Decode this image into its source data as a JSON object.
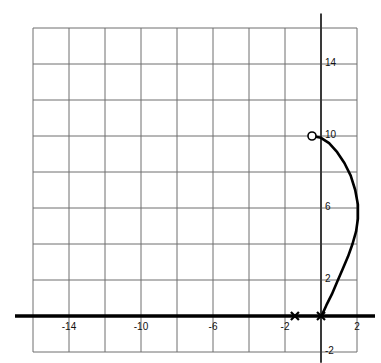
{
  "figure": {
    "kind": "cartesian-graph",
    "background_color": "#ffffff",
    "grid_color": "#6e6e6e",
    "axis_color": "#000000",
    "curve_color": "#000000"
  },
  "axes": {
    "x": {
      "label": "",
      "min": -16,
      "max": 2,
      "step": 2,
      "tick_labels": [
        "-14",
        "-10",
        "-6",
        "-2",
        "2"
      ],
      "tick_values": [
        -14,
        -10,
        -6,
        -2,
        2
      ],
      "axis_line_y": 0,
      "axis_line_from": -17,
      "axis_line_to": 3
    },
    "y": {
      "label": "",
      "min": -2,
      "max": 16,
      "step": 2,
      "tick_labels": [
        "14",
        "10",
        "6",
        "2",
        "-2"
      ],
      "tick_values": [
        14,
        10,
        6,
        2,
        -2
      ],
      "axis_line_x": 0,
      "axis_line_from": -2.6,
      "axis_line_to": 16.8
    },
    "grid": {
      "visible": true,
      "columns": 9,
      "rows": 9,
      "x_lines": [
        -16,
        -14,
        -12,
        -10,
        -8,
        -6,
        -4,
        -2,
        0,
        2
      ],
      "y_lines": [
        -2,
        0,
        2,
        4,
        6,
        8,
        10,
        12,
        14,
        16
      ]
    }
  },
  "chart_data": {
    "type": "line",
    "title": "",
    "subtitle": "",
    "xlabel": "",
    "ylabel": "",
    "xlim": [
      -16,
      2
    ],
    "ylim": [
      -2,
      16
    ],
    "grid": true,
    "legend": "none",
    "series": [
      {
        "name": "curve",
        "type": "parametric-arc",
        "color": "#000000",
        "line_width": 2.6,
        "points": [
          [
            -0.5,
            10.0
          ],
          [
            0.0,
            9.9
          ],
          [
            0.45,
            9.6
          ],
          [
            0.9,
            9.1
          ],
          [
            1.3,
            8.5
          ],
          [
            1.65,
            7.8
          ],
          [
            1.9,
            7.0
          ],
          [
            2.05,
            6.2
          ],
          [
            2.05,
            5.4
          ],
          [
            1.95,
            4.7
          ],
          [
            1.75,
            4.0
          ],
          [
            1.5,
            3.3
          ],
          [
            1.2,
            2.6
          ],
          [
            0.9,
            1.9
          ],
          [
            0.6,
            1.2
          ],
          [
            0.3,
            0.6
          ],
          [
            0.05,
            0.05
          ]
        ]
      }
    ],
    "markers": [
      {
        "name": "open-endpoint",
        "shape": "open-circle",
        "x": -0.5,
        "y": 10.0,
        "fill": "#ffffff",
        "stroke": "#000000",
        "label": ""
      },
      {
        "name": "origin-cross",
        "shape": "x-cross",
        "x": 0.0,
        "y": 0.0,
        "stroke": "#000000",
        "label": ""
      },
      {
        "name": "axis-cross",
        "shape": "x-cross",
        "x": -1.45,
        "y": 0.0,
        "stroke": "#000000",
        "label": ""
      }
    ],
    "annotations": []
  }
}
